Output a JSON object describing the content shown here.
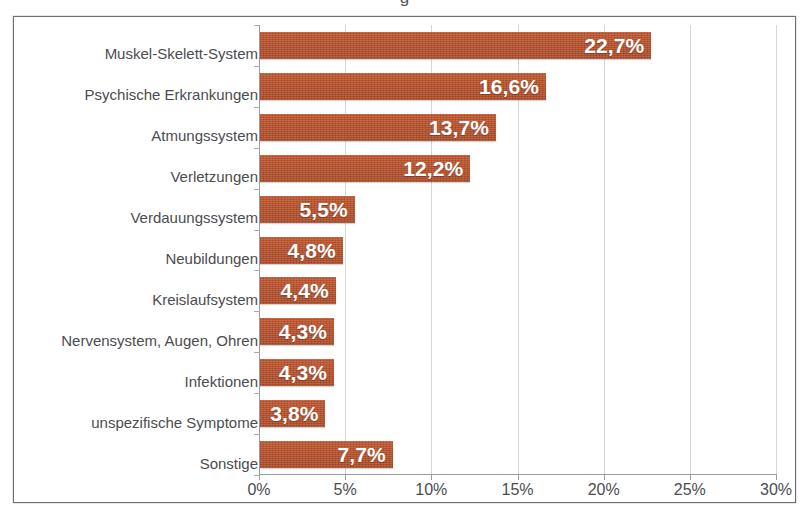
{
  "figure": {
    "title_cut_off": "g",
    "background_color": "#ffffff",
    "frame_color": "#6e6f72"
  },
  "chart_data": {
    "type": "bar",
    "orientation": "horizontal",
    "title": "",
    "subtitle": "",
    "xlabel": "",
    "ylabel": "",
    "xlim": [
      0,
      30
    ],
    "ylim": null,
    "grid": true,
    "grid_axis": "x",
    "legend": false,
    "legend_position": "none",
    "bar_color": "#b8502a",
    "value_label_color": "#ffffff",
    "tick_label_color": "#4b4c50",
    "gridline_color": "#d4d6da",
    "axis_color": "#9a9ca0",
    "value_suffix": "%",
    "decimal_separator": ",",
    "categories": [
      "Muskel-Skelett-System",
      "Psychische Erkrankungen",
      "Atmungssystem",
      "Verletzungen",
      "Verdauungssystem",
      "Neubildungen",
      "Kreislaufsystem",
      "Nervensystem, Augen,  Ohren",
      "Infektionen",
      "unspezifische Symptome",
      "Sonstige"
    ],
    "values": [
      22.7,
      16.6,
      13.7,
      12.2,
      5.5,
      4.8,
      4.4,
      4.3,
      4.3,
      3.8,
      7.7
    ],
    "value_labels": [
      "22,7%",
      "16,6%",
      "13,7%",
      "12,2%",
      "5,5%",
      "4,8%",
      "4,4%",
      "4,3%",
      "4,3%",
      "3,8%",
      "7,7%"
    ],
    "xticks": [
      0,
      5,
      10,
      15,
      20,
      25,
      30
    ],
    "xticklabels": [
      "0%",
      "5%",
      "10%",
      "15%",
      "20%",
      "25%",
      "30%"
    ]
  }
}
